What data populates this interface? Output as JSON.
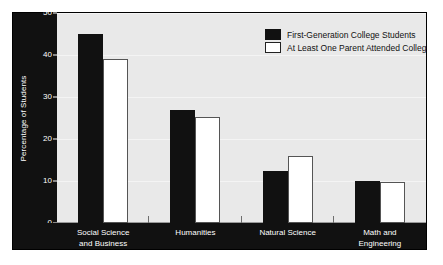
{
  "chart_data": {
    "type": "bar",
    "title": "",
    "subtitle": "",
    "xlabel": "",
    "ylabel": "Percentage of Students",
    "ylim": [
      0,
      50
    ],
    "yticks": [
      0,
      10,
      20,
      30,
      40,
      50
    ],
    "ytick_labels": [
      "0",
      "10",
      "20",
      "30",
      "40",
      "50"
    ],
    "grid": true,
    "legend_position": "top-right",
    "categories": [
      "Social Science and Business",
      "Humanities",
      "Natural Science",
      "Math and Engineering"
    ],
    "category_lines": [
      [
        "Social Science",
        "and Business"
      ],
      [
        "Humanities",
        ""
      ],
      [
        "Natural Science",
        ""
      ],
      [
        "Math and",
        "Engineering"
      ]
    ],
    "series": [
      {
        "name": "First-Generation College Students",
        "color": "#111111",
        "values": [
          45,
          27,
          12.5,
          10
        ]
      },
      {
        "name": "At Least One Parent Attended College",
        "color": "#ffffff",
        "values": [
          39,
          25.3,
          16,
          9.7
        ]
      }
    ]
  },
  "legend": {
    "items": [
      {
        "label": "First-Generation College Students",
        "swatch": "dark-swatch"
      },
      {
        "label": "At Least One Parent Attended College",
        "swatch": "light-swatch"
      }
    ]
  },
  "colors": {
    "frame": "#111111",
    "plot_background": "#e9e9e9",
    "gridline": "#f4f4f4",
    "axis_text": "#ffffff",
    "series_dark": "#111111",
    "series_light": "#ffffff"
  }
}
